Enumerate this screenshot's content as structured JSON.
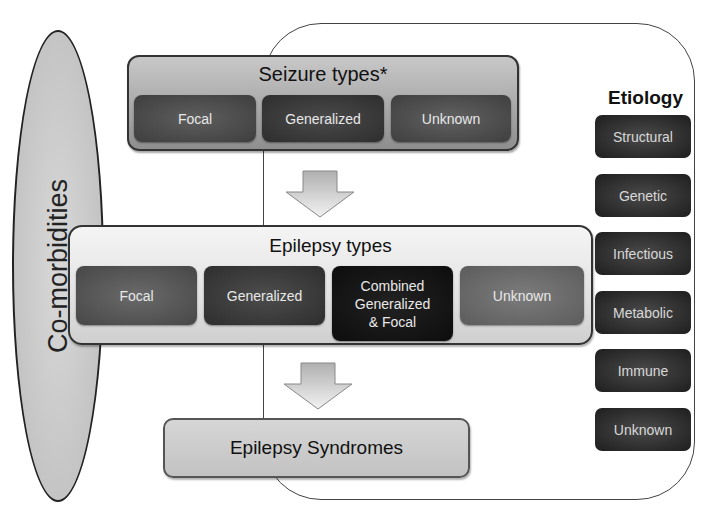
{
  "comorbidities": {
    "label": "Co-morbidities"
  },
  "seizure_types": {
    "title": "Seizure types*",
    "items": [
      {
        "label": "Focal"
      },
      {
        "label": "Generalized"
      },
      {
        "label": "Unknown"
      }
    ]
  },
  "epilepsy_types": {
    "title": "Epilepsy types",
    "items": [
      {
        "label": "Focal"
      },
      {
        "label": "Generalized"
      },
      {
        "label": "Combined Generalized & Focal",
        "lines": [
          "Combined",
          "Generalized",
          "& Focal"
        ]
      },
      {
        "label": "Unknown"
      }
    ]
  },
  "epilepsy_syndromes": {
    "label": "Epilepsy Syndromes"
  },
  "etiology": {
    "title": "Etiology",
    "items": [
      {
        "label": "Structural"
      },
      {
        "label": "Genetic"
      },
      {
        "label": "Infectious"
      },
      {
        "label": "Metabolic"
      },
      {
        "label": "Immune"
      },
      {
        "label": "Unknown"
      }
    ]
  },
  "arrows": [
    {
      "from": "Seizure types",
      "to": "Epilepsy types",
      "direction": "down"
    },
    {
      "from": "Epilepsy types",
      "to": "Epilepsy Syndromes",
      "direction": "down"
    }
  ]
}
